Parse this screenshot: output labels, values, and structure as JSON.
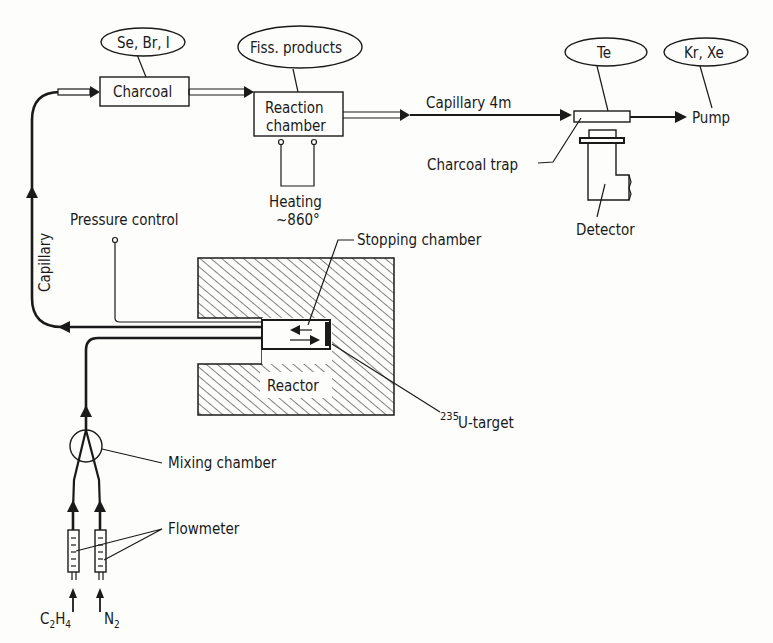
{
  "diagram": {
    "type": "flow-schematic",
    "nodes": {
      "se_br_i": {
        "label": "Se, Br, I",
        "shape": "ellipse"
      },
      "fiss_products": {
        "label": "Fiss. products",
        "shape": "ellipse"
      },
      "te": {
        "label": "Te",
        "shape": "ellipse"
      },
      "kr_xe": {
        "label": "Kr, Xe",
        "shape": "ellipse"
      },
      "charcoal": {
        "label": "Charcoal",
        "shape": "box"
      },
      "reaction_chamber": {
        "line1": "Reaction",
        "line2": "chamber",
        "shape": "box"
      },
      "heating": {
        "line1": "Heating",
        "line2": "~860°"
      },
      "capillary_4m": {
        "label": "Capillary 4m"
      },
      "pump": {
        "label": "Pump"
      },
      "charcoal_trap": {
        "label": "Charcoal trap"
      },
      "detector": {
        "label": "Detector"
      },
      "capillary": {
        "label": "Capillary"
      },
      "pressure_control": {
        "label": "Pressure control"
      },
      "stopping_chamber": {
        "label": "Stopping chamber"
      },
      "reactor": {
        "label": "Reactor"
      },
      "u_target": {
        "superscript": "235",
        "label": "U-target"
      },
      "mixing_chamber": {
        "label": "Mixing chamber"
      },
      "flowmeter": {
        "label": "Flowmeter"
      },
      "c2h4": {
        "base": "C",
        "sub1": "2",
        "mid": "H",
        "sub2": "4"
      },
      "n2": {
        "base": "N",
        "sub": "2"
      }
    },
    "edges": [
      {
        "from": "c2h4",
        "to": "flowmeter",
        "label": ""
      },
      {
        "from": "n2",
        "to": "flowmeter",
        "label": ""
      },
      {
        "from": "flowmeter",
        "to": "mixing_chamber",
        "label": ""
      },
      {
        "from": "mixing_chamber",
        "to": "stopping_chamber",
        "label": ""
      },
      {
        "from": "stopping_chamber",
        "to": "charcoal",
        "label": "Capillary"
      },
      {
        "from": "charcoal",
        "to": "reaction_chamber",
        "label": ""
      },
      {
        "from": "reaction_chamber",
        "to": "charcoal_trap",
        "label": "Capillary 4m"
      },
      {
        "from": "charcoal_trap",
        "to": "pump",
        "label": ""
      }
    ],
    "colors": {
      "ink": "#1a1a1a",
      "paper": "#fdfdfc"
    }
  }
}
